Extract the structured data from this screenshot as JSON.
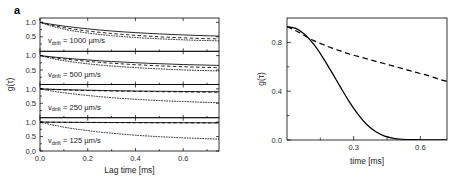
{
  "figure": {
    "panels": [
      {
        "label": "a"
      },
      {
        "label": "b"
      }
    ]
  },
  "panel_a": {
    "label": "a",
    "xlabel": "Lag time [ms]",
    "ylabel": "g(τ)",
    "xticks": [
      "0.0",
      "0.2",
      "0.4",
      "0.6"
    ],
    "yticks": [
      "0.0",
      "0.5",
      "1.0"
    ],
    "annotations": [
      {
        "prefix": "v",
        "sub": "drift",
        "value": " = 1000 µm/s"
      },
      {
        "prefix": "v",
        "sub": "drift",
        "value": " = 500 µm/s"
      },
      {
        "prefix": "v",
        "sub": "drift",
        "value": " = 250 µm/s"
      },
      {
        "prefix": "v",
        "sub": "drift",
        "value": " = 125 µm/s"
      }
    ]
  },
  "panel_b": {
    "label": "b",
    "xlabel": "time [ms]",
    "ylabel": "g(τ)",
    "xticks": [
      "0.3",
      "0.6"
    ],
    "yticks": [
      "0.0",
      "0.4",
      "0.8"
    ]
  },
  "chart_data": [
    {
      "type": "line",
      "panel": "a",
      "title": "",
      "xlabel": "Lag time [ms]",
      "ylabel": "g(τ)",
      "xlim": [
        0.0,
        0.75
      ],
      "ylim": [
        0.0,
        1.15
      ],
      "xticks": [
        0.0,
        0.2,
        0.4,
        0.6
      ],
      "yticks": [
        0.0,
        0.5,
        1.0
      ],
      "grid": false,
      "legend": "none",
      "subplots": [
        {
          "annotation": "v_drift = 1000 µm/s",
          "x": [
            0.0,
            0.05,
            0.1,
            0.15,
            0.2,
            0.25,
            0.3,
            0.35,
            0.4,
            0.45,
            0.5,
            0.55,
            0.6,
            0.65,
            0.7,
            0.75
          ],
          "series": [
            {
              "name": "solid",
              "style": "solid",
              "values": [
                1.0,
                0.93,
                0.87,
                0.82,
                0.775,
                0.735,
                0.7,
                0.67,
                0.645,
                0.62,
                0.6,
                0.58,
                0.565,
                0.55,
                0.535,
                0.525
              ]
            },
            {
              "name": "dashed",
              "style": "dashed",
              "values": [
                1.0,
                0.9,
                0.82,
                0.755,
                0.7,
                0.655,
                0.615,
                0.58,
                0.55,
                0.525,
                0.5,
                0.48,
                0.465,
                0.45,
                0.435,
                0.425
              ]
            },
            {
              "name": "dotted",
              "style": "dotted",
              "values": [
                1.0,
                0.865,
                0.765,
                0.69,
                0.63,
                0.58,
                0.54,
                0.505,
                0.475,
                0.45,
                0.43,
                0.41,
                0.395,
                0.38,
                0.37,
                0.36
              ]
            }
          ]
        },
        {
          "annotation": "v_drift = 500 µm/s",
          "x": [
            0.0,
            0.05,
            0.1,
            0.15,
            0.2,
            0.25,
            0.3,
            0.35,
            0.4,
            0.45,
            0.5,
            0.55,
            0.6,
            0.65,
            0.7,
            0.75
          ],
          "series": [
            {
              "name": "solid",
              "style": "solid",
              "values": [
                1.0,
                0.955,
                0.915,
                0.88,
                0.85,
                0.82,
                0.795,
                0.775,
                0.755,
                0.735,
                0.72,
                0.705,
                0.69,
                0.68,
                0.67,
                0.66
              ]
            },
            {
              "name": "dashed",
              "style": "dashed",
              "values": [
                1.0,
                0.935,
                0.885,
                0.84,
                0.8,
                0.765,
                0.735,
                0.71,
                0.685,
                0.665,
                0.645,
                0.63,
                0.615,
                0.6,
                0.59,
                0.58
              ]
            },
            {
              "name": "dotted",
              "style": "dotted",
              "values": [
                1.0,
                0.9,
                0.825,
                0.765,
                0.715,
                0.675,
                0.64,
                0.61,
                0.585,
                0.56,
                0.54,
                0.52,
                0.505,
                0.49,
                0.48,
                0.47
              ]
            }
          ]
        },
        {
          "annotation": "v_drift = 250 µm/s",
          "x": [
            0.0,
            0.05,
            0.1,
            0.15,
            0.2,
            0.25,
            0.3,
            0.35,
            0.4,
            0.45,
            0.5,
            0.55,
            0.6,
            0.65,
            0.7,
            0.75
          ],
          "series": [
            {
              "name": "solid",
              "style": "solid",
              "values": [
                1.0,
                0.985,
                0.972,
                0.962,
                0.953,
                0.945,
                0.938,
                0.932,
                0.926,
                0.921,
                0.917,
                0.913,
                0.909,
                0.906,
                0.903,
                0.9
              ]
            },
            {
              "name": "dashed",
              "style": "dashed",
              "values": [
                1.0,
                0.98,
                0.965,
                0.952,
                0.942,
                0.933,
                0.925,
                0.918,
                0.912,
                0.906,
                0.901,
                0.897,
                0.893,
                0.889,
                0.886,
                0.883
              ]
            },
            {
              "name": "dotted",
              "style": "dotted",
              "values": [
                1.0,
                0.925,
                0.865,
                0.815,
                0.77,
                0.73,
                0.695,
                0.665,
                0.64,
                0.615,
                0.595,
                0.575,
                0.56,
                0.545,
                0.53,
                0.52
              ]
            }
          ]
        },
        {
          "annotation": "v_drift = 125 µm/s",
          "x": [
            0.0,
            0.05,
            0.1,
            0.15,
            0.2,
            0.25,
            0.3,
            0.35,
            0.4,
            0.45,
            0.5,
            0.55,
            0.6,
            0.65,
            0.7,
            0.75
          ],
          "series": [
            {
              "name": "solid",
              "style": "solid",
              "values": [
                1.0,
                0.997,
                0.994,
                0.992,
                0.99,
                0.988,
                0.986,
                0.985,
                0.984,
                0.983,
                0.982,
                0.981,
                0.98,
                0.979,
                0.978,
                0.977
              ]
            },
            {
              "name": "dashed",
              "style": "dashed",
              "values": [
                1.0,
                0.995,
                0.991,
                0.988,
                0.985,
                0.983,
                0.981,
                0.979,
                0.977,
                0.976,
                0.975,
                0.974,
                0.973,
                0.972,
                0.971,
                0.97
              ]
            },
            {
              "name": "dotted",
              "style": "dotted",
              "values": [
                1.0,
                0.905,
                0.825,
                0.76,
                0.705,
                0.655,
                0.615,
                0.58,
                0.545,
                0.52,
                0.495,
                0.475,
                0.455,
                0.44,
                0.425,
                0.41
              ]
            }
          ]
        }
      ]
    },
    {
      "type": "line",
      "panel": "b",
      "title": "",
      "xlabel": "time [ms]",
      "ylabel": "g(τ)",
      "xlim": [
        0.0,
        0.72
      ],
      "ylim": [
        0.0,
        1.0
      ],
      "xticks": [
        0.3,
        0.6
      ],
      "yticks": [
        0.0,
        0.4,
        0.8
      ],
      "grid": false,
      "legend": "none",
      "x": [
        0.0,
        0.04,
        0.08,
        0.12,
        0.16,
        0.2,
        0.24,
        0.28,
        0.32,
        0.36,
        0.4,
        0.44,
        0.48,
        0.52,
        0.56,
        0.6,
        0.64,
        0.68,
        0.72
      ],
      "series": [
        {
          "name": "solid",
          "style": "solid",
          "values": [
            0.93,
            0.915,
            0.865,
            0.785,
            0.68,
            0.56,
            0.435,
            0.315,
            0.21,
            0.125,
            0.068,
            0.032,
            0.014,
            0.006,
            0.003,
            0.002,
            0.001,
            0.001,
            0.0
          ]
        },
        {
          "name": "dashed",
          "style": "dashed",
          "values": [
            0.93,
            0.895,
            0.855,
            0.815,
            0.785,
            0.755,
            0.73,
            0.705,
            0.685,
            0.665,
            0.645,
            0.625,
            0.605,
            0.585,
            0.565,
            0.545,
            0.525,
            0.5,
            0.48
          ]
        }
      ]
    }
  ]
}
